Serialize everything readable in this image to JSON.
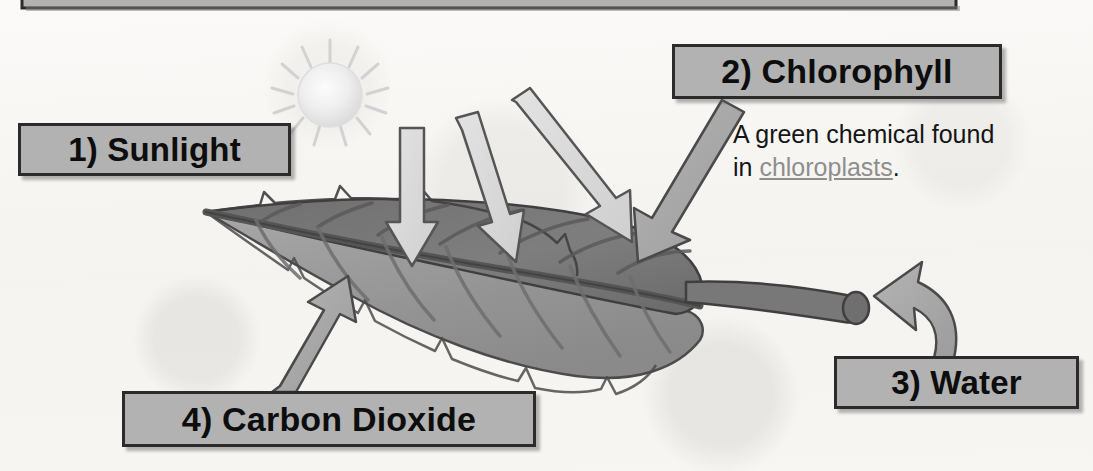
{
  "diagram": {
    "title_bar": {
      "present": true
    },
    "background_color": "#f7f6f3",
    "box_fill": "#b2b2b2",
    "box_border": "#2b2b2b",
    "labels": [
      {
        "id": "sunlight",
        "text": "1) Sunlight",
        "number": "1"
      },
      {
        "id": "chlorophyll",
        "text": "2) Chlorophyll",
        "number": "2"
      },
      {
        "id": "water",
        "text": "3) Water",
        "number": "3"
      },
      {
        "id": "carbon_dioxide",
        "text": "4) Carbon Dioxide",
        "number": "4"
      }
    ],
    "chlorophyll_note": {
      "line1": "A green chemical found",
      "line2_prefix": "in ",
      "link_text": "chloroplasts",
      "line2_suffix": "."
    },
    "illustration": {
      "sun": "sun-icon",
      "leaf": "leaf-illustration",
      "light_rays": "light-ray-arrows",
      "water_arrow": "water-arrow",
      "co2_arrow": "carbon-dioxide-arrow",
      "chlorophyll_arrow": "chlorophyll-arrow"
    }
  }
}
